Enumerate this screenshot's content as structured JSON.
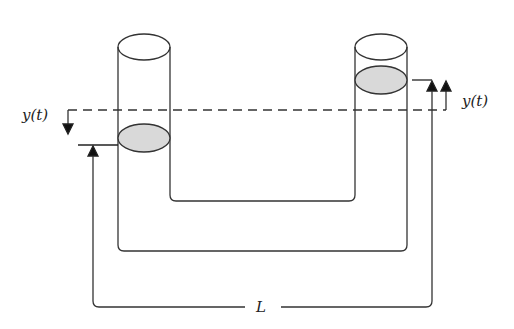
{
  "diagram": {
    "labels": {
      "left_displacement": "y(t)",
      "right_displacement": "y(t)",
      "length": "L"
    },
    "colors": {
      "stroke": "#333333",
      "liquid_surface": "#d9d9d9",
      "background": "#ffffff"
    },
    "components": [
      "left-vertical-tube",
      "right-vertical-tube",
      "connecting-bottom-tube",
      "left-liquid-surface",
      "right-liquid-surface",
      "equilibrium-dashed-line",
      "length-L-bracket"
    ]
  }
}
